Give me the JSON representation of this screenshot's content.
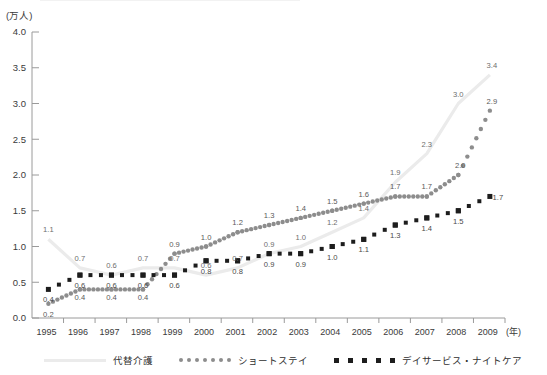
{
  "axes": {
    "y_unit": "(万人)",
    "x_unit": "(年)",
    "y_ticks": [
      "0.0",
      "0.5",
      "1.0",
      "1.5",
      "2.0",
      "2.5",
      "3.0",
      "3.5",
      "4.0"
    ],
    "x_ticks": [
      "1995",
      "1996",
      "1997",
      "1998",
      "1999",
      "2000",
      "2001",
      "2002",
      "2003",
      "2004",
      "2005",
      "2006",
      "2007",
      "2008",
      "2009"
    ]
  },
  "legend": {
    "items": [
      {
        "label": "代替介護",
        "marker": "line",
        "color": "#ebebeb"
      },
      {
        "label": "ショートステイ",
        "marker": "dots",
        "color": "#8d8d8d"
      },
      {
        "label": "デイサービス・ナイトケア",
        "marker": "squares",
        "color": "#1d1d1d"
      }
    ]
  },
  "chart_data": {
    "type": "line",
    "title": "",
    "xlabel": "(年)",
    "ylabel": "(万人)",
    "ylim": [
      0.0,
      4.0
    ],
    "ygrid": false,
    "legend_position": "bottom",
    "categories": [
      "1995",
      "1996",
      "1997",
      "1998",
      "1999",
      "2000",
      "2001",
      "2002",
      "2003",
      "2004",
      "2005",
      "2006",
      "2007",
      "2008",
      "2009"
    ],
    "series": [
      {
        "name": "代替介護",
        "style": "solid-light-line",
        "color": "#ebebeb",
        "values": [
          1.1,
          0.7,
          0.6,
          0.7,
          0.7,
          0.6,
          0.7,
          0.9,
          1.0,
          1.2,
          1.4,
          1.9,
          2.3,
          3.0,
          3.4
        ]
      },
      {
        "name": "ショートステイ",
        "style": "dotted",
        "color": "#8d8d8d",
        "values": [
          0.2,
          0.4,
          0.4,
          0.4,
          0.9,
          1.0,
          1.2,
          1.3,
          1.4,
          1.5,
          1.6,
          1.7,
          1.7,
          2.0,
          2.9
        ]
      },
      {
        "name": "デイサービス・ナイトケア",
        "style": "square-dotted",
        "color": "#1d1d1d",
        "values": [
          0.4,
          0.6,
          0.6,
          0.6,
          0.6,
          0.8,
          0.8,
          0.9,
          0.9,
          1.0,
          1.1,
          1.3,
          1.4,
          1.5,
          1.7
        ]
      }
    ],
    "data_labels": {
      "代替介護": [
        "1.1",
        "0.7",
        "0.6",
        "0.7",
        "0.7",
        "0.6",
        "0.7",
        "0.9",
        "1.0",
        "1.2",
        "1.4",
        "1.9",
        "2.3",
        "3.0",
        "3.4"
      ],
      "ショートステイ": [
        "0.2",
        "0.4",
        "0.4",
        "0.4",
        "0.9",
        "1.0",
        "1.2",
        "1.3",
        "1.4",
        "1.5",
        "1.6",
        "1.7",
        "1.7",
        "2.0",
        "2.9"
      ],
      "デイサービス・ナイトケア": [
        "0.4",
        "0.6",
        "0.6",
        "0.6",
        "0.6",
        "0.8",
        "0.8",
        "0.9",
        "0.9",
        "1.0",
        "1.1",
        "1.3",
        "1.4",
        "1.5",
        "1.7"
      ]
    }
  }
}
